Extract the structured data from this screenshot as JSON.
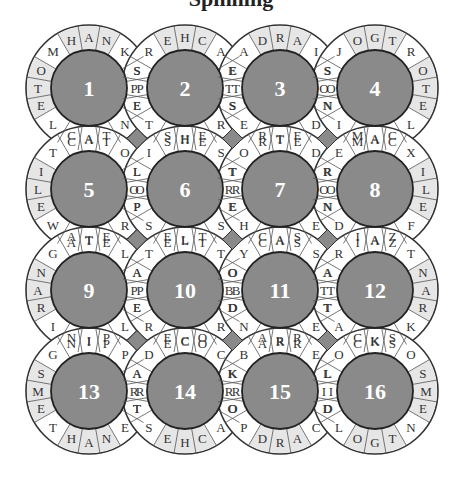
{
  "puzzle": {
    "title": "Spinning",
    "circles": [
      {
        "number": "1",
        "top": [
          "H",
          "A",
          "N"
        ],
        "ne": "K",
        "right": [
          "S",
          "P",
          "E"
        ],
        "se": "N",
        "bottom": [
          "C",
          "A",
          "T"
        ],
        "sw": "L",
        "left": [
          "O",
          "T",
          "E"
        ],
        "nw": "M"
      },
      {
        "number": "2",
        "top": [
          "E",
          "H",
          "C"
        ],
        "ne": "A",
        "right": [
          "E",
          "T",
          "S"
        ],
        "se": "R",
        "bottom": [
          "S",
          "H",
          "E"
        ],
        "sw": "T",
        "left": [
          "S",
          "P",
          "E"
        ],
        "nw": "R"
      },
      {
        "number": "3",
        "top": [
          "D",
          "R",
          "A"
        ],
        "ne": "I",
        "right": [
          "S",
          "O",
          "N"
        ],
        "se": "D",
        "bottom": [
          "R",
          "T",
          "E"
        ],
        "sw": "E",
        "left": [
          "E",
          "T",
          "S"
        ],
        "nw": "A"
      },
      {
        "number": "4",
        "top": [
          "O",
          "G",
          "T"
        ],
        "ne": "R",
        "right": [
          "O",
          "T",
          "E"
        ],
        "se": "L",
        "bottom": [
          "M",
          "A",
          "C"
        ],
        "sw": "I",
        "left": [
          "S",
          "O",
          "N"
        ],
        "nw": "J"
      },
      {
        "number": "5",
        "top": [
          "C",
          "A",
          "T"
        ],
        "ne": "O",
        "right": [
          "L",
          "O",
          "P"
        ],
        "se": "R",
        "bottom": [
          "A",
          "T",
          "E"
        ],
        "sw": "W",
        "left": [
          "I",
          "L",
          "E"
        ],
        "nw": "T"
      },
      {
        "number": "6",
        "top": [
          "S",
          "H",
          "E"
        ],
        "ne": "S",
        "right": [
          "T",
          "R",
          "E"
        ],
        "se": "S",
        "bottom": [
          "E",
          "L",
          "T"
        ],
        "sw": "S",
        "left": [
          "L",
          "O",
          "P"
        ],
        "nw": "I"
      },
      {
        "number": "7",
        "top": [
          "R",
          "T",
          "E"
        ],
        "ne": "D",
        "right": [
          "R",
          "O",
          "N"
        ],
        "se": "E",
        "bottom": [
          "C",
          "A",
          "S"
        ],
        "sw": "H",
        "left": [
          "T",
          "R",
          "E"
        ],
        "nw": "O"
      },
      {
        "number": "8",
        "top": [
          "M",
          "A",
          "C"
        ],
        "ne": "X",
        "right": [
          "I",
          "L",
          "E"
        ],
        "se": "F",
        "bottom": [
          "I",
          "A",
          "Z"
        ],
        "sw": "D",
        "left": [
          "R",
          "O",
          "N"
        ],
        "nw": "E"
      },
      {
        "number": "9",
        "top": [
          "A",
          "T",
          "E"
        ],
        "ne": "L",
        "right": [
          "A",
          "P",
          "E"
        ],
        "se": "L",
        "bottom": [
          "N",
          "I",
          "P"
        ],
        "sw": "I",
        "left": [
          "N",
          "A",
          "R"
        ],
        "nw": "G"
      },
      {
        "number": "10",
        "top": [
          "E",
          "L",
          "T"
        ],
        "ne": "T",
        "right": [
          "O",
          "B",
          "D"
        ],
        "se": "R",
        "bottom": [
          "E",
          "C",
          "O"
        ],
        "sw": "R",
        "left": [
          "A",
          "P",
          "E"
        ],
        "nw": "T"
      },
      {
        "number": "11",
        "top": [
          "C",
          "A",
          "S"
        ],
        "ne": "S",
        "right": [
          "A",
          "T",
          "T"
        ],
        "se": "E",
        "bottom": [
          "A",
          "R",
          "R"
        ],
        "sw": "N",
        "left": [
          "O",
          "B",
          "D"
        ],
        "nw": "Y"
      },
      {
        "number": "12",
        "top": [
          "I",
          "A",
          "Z"
        ],
        "ne": "T",
        "right": [
          "N",
          "A",
          "R"
        ],
        "se": "K",
        "bottom": [
          "C",
          "K",
          "S"
        ],
        "sw": "A",
        "left": [
          "A",
          "T",
          "T"
        ],
        "nw": "R"
      },
      {
        "number": "13",
        "top": [
          "N",
          "I",
          "P"
        ],
        "ne": "P",
        "right": [
          "A",
          "R",
          "T"
        ],
        "se": "E",
        "bottom": [
          "H",
          "A",
          "N"
        ],
        "sw": "T",
        "left": [
          "S",
          "M",
          "E"
        ],
        "nw": "G"
      },
      {
        "number": "14",
        "top": [
          "E",
          "C",
          "O"
        ],
        "ne": "C",
        "right": [
          "K",
          "R",
          "O"
        ],
        "se": "A",
        "bottom": [
          "E",
          "H",
          "C"
        ],
        "sw": "S",
        "left": [
          "A",
          "R",
          "T"
        ],
        "nw": "D"
      },
      {
        "number": "15",
        "top": [
          "A",
          "R",
          "R"
        ],
        "ne": "E",
        "right": [
          "L",
          "I",
          "D"
        ],
        "se": "C",
        "bottom": [
          "D",
          "R",
          "A"
        ],
        "sw": "P",
        "left": [
          "K",
          "R",
          "O"
        ],
        "nw": "B"
      },
      {
        "number": "16",
        "top": [
          "C",
          "K",
          "S"
        ],
        "ne": "O",
        "right": [
          "S",
          "M",
          "E"
        ],
        "se": "N",
        "bottom": [
          "O",
          "G",
          "T"
        ],
        "sw": "L",
        "left": [
          "L",
          "I",
          "D"
        ],
        "nw": "O"
      }
    ]
  }
}
